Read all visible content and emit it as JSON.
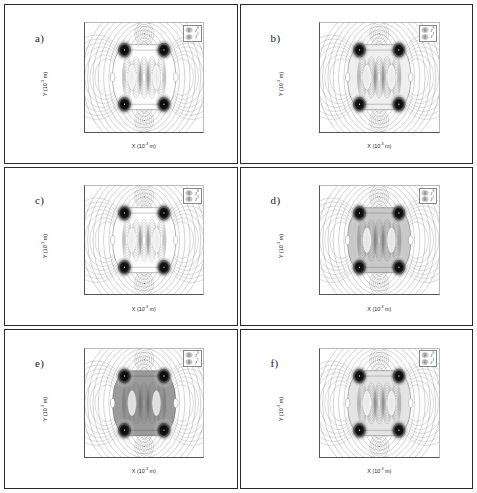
{
  "figure": {
    "panels": [
      {
        "tag": "a)",
        "name": "panel-a",
        "fill_level": "none",
        "lobe_dark": 0.92,
        "body_shade": "#ffffff",
        "ring_count": 11,
        "core_r": 5.0
      },
      {
        "tag": "b)",
        "name": "panel-b",
        "fill_level": "light",
        "lobe_dark": 0.95,
        "body_shade": "#efefef",
        "ring_count": 11,
        "core_r": 5.0
      },
      {
        "tag": "c)",
        "name": "panel-c",
        "fill_level": "none",
        "lobe_dark": 0.9,
        "body_shade": "#ffffff",
        "ring_count": 11,
        "core_r": 5.0
      },
      {
        "tag": "d)",
        "name": "panel-d",
        "fill_level": "medium",
        "lobe_dark": 0.97,
        "body_shade": "#c9c9c9",
        "ring_count": 11,
        "core_r": 5.0
      },
      {
        "tag": "e)",
        "name": "panel-e",
        "fill_level": "dark",
        "lobe_dark": 1.0,
        "body_shade": "#9a9a9a",
        "ring_count": 11,
        "core_r": 5.0
      },
      {
        "tag": "f)",
        "name": "panel-f",
        "fill_level": "light",
        "lobe_dark": 0.93,
        "body_shade": "#e4e4e4",
        "ring_count": 11,
        "core_r": 5.0
      }
    ],
    "legend": {
      "entries": [
        {
          "label": "J",
          "sup": "0",
          "swatch": "concentric-rings-icon"
        },
        {
          "label": "J",
          "sup": "1",
          "swatch": "concentric-rings-icon"
        }
      ]
    }
  },
  "chart_data": {
    "type": "contour",
    "title": "",
    "panel_count": 6,
    "panel_labels": [
      "a)",
      "b)",
      "c)",
      "d)",
      "e)",
      "f)"
    ],
    "xlabel": "X (10⁻³ m)",
    "ylabel": "Y (10⁻³ m)",
    "xlabel_text": "X",
    "xlabel_unit": "10",
    "xlabel_exp": "-3",
    "xlabel_unit_tail": " m)",
    "ylabel_text": "Y",
    "xlim": [
      -15,
      15
    ],
    "ylim": [
      -10,
      10
    ],
    "xticks": [
      -10,
      -5,
      0,
      5,
      10
    ],
    "yticks": [
      10,
      5,
      0,
      -5,
      -10
    ],
    "xticklabels": [
      "-10",
      "-5",
      "0",
      "5",
      "10"
    ],
    "yticklabels": [
      "10",
      "5",
      "0",
      "-5",
      "-10"
    ],
    "grid": false,
    "legend_position": "upper right",
    "legend_entries": [
      "J⁰",
      "J¹"
    ],
    "series": [
      {
        "name": "J0",
        "description": "current density zeroth order, concentric ring contours"
      },
      {
        "name": "J1",
        "description": "current density first order, concentric ring contours"
      }
    ],
    "hotspots": {
      "description": "four dark current-density lobes per panel",
      "coordinates": [
        [
          -5,
          5
        ],
        [
          5,
          5
        ],
        [
          -5,
          -5
        ],
        [
          5,
          -5
        ]
      ],
      "units": "10^-3 m"
    },
    "saddle_points": {
      "coordinates": [
        [
          -8,
          0
        ],
        [
          8,
          0
        ],
        [
          0,
          8
        ],
        [
          0,
          -8
        ]
      ],
      "units": "10^-3 m"
    },
    "boundary": {
      "shape": "rounded-hexagon",
      "semi_x": 8,
      "semi_y": 6,
      "units": "10^-3 m"
    }
  }
}
